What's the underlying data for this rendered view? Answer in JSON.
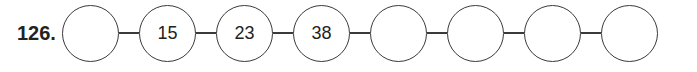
{
  "problem": {
    "number": "126.",
    "sequence": [
      "",
      "15",
      "23",
      "38",
      "",
      "",
      "",
      ""
    ]
  }
}
